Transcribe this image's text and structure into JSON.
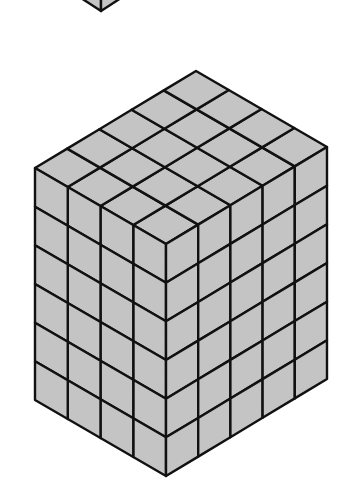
{
  "figure": {
    "cubes_left_face": 4,
    "cubes_right_face": 5,
    "cubes_tall": 6,
    "total_cubes": 120,
    "colors": {
      "face_fill": "#c4c4c4",
      "edge": "#111111",
      "background": "#ffffff"
    }
  },
  "partial_shape": {
    "description": "Partially visible cube cropped at top edge"
  }
}
